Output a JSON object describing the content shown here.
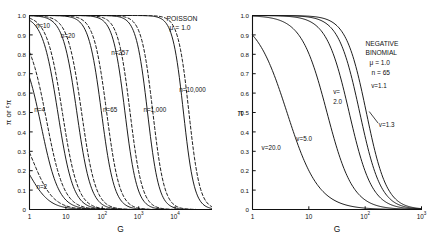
{
  "figure": {
    "background": "#ffffff",
    "ink": "#111111",
    "panel_count": 2
  },
  "chart_data": [
    {
      "type": "line",
      "panel": "left",
      "title": "POISSON",
      "annotations": [
        "POISSON",
        "μ = 1.0"
      ],
      "mu": "1.0",
      "xlabel": "G",
      "ylabel": "π or ᶜπ",
      "xscale": "log",
      "xlim": [
        1,
        100000
      ],
      "ylim": [
        0,
        1
      ],
      "xticks": [
        "1",
        "10",
        "10²",
        "10³",
        "10⁴"
      ],
      "xtick_values": [
        1,
        10,
        100,
        1000,
        10000
      ],
      "yticks": [
        "0",
        "0.1",
        "0.2",
        "0.3",
        "0.4",
        "0.5",
        "0.6",
        "0.7",
        "0.8",
        "0.9",
        "1.0"
      ],
      "ytick_values": [
        0,
        0.1,
        0.2,
        0.3,
        0.4,
        0.5,
        0.6,
        0.7,
        0.8,
        0.9,
        1.0
      ],
      "grid": false,
      "legend": "inline-curve-labels",
      "linestyles": [
        "solid",
        "dashed"
      ],
      "series": [
        {
          "name": "n=2",
          "label": "n=2",
          "style": "solid",
          "y0": 0.36,
          "x50": 1.0,
          "slope": 1.55
        },
        {
          "name": "n=2d",
          "label": "",
          "style": "dashed",
          "y0": 0.5,
          "x50": 1.25,
          "slope": 1.55
        },
        {
          "name": "n=4",
          "label": "n=4",
          "style": "solid",
          "y0": 0.86,
          "x50": 2.1,
          "slope": 1.8
        },
        {
          "name": "n=4d",
          "label": "",
          "style": "dashed",
          "y0": 0.93,
          "x50": 2.9,
          "slope": 1.8
        },
        {
          "name": "n=10",
          "label": "n=10",
          "style": "solid",
          "y0": 1.0,
          "x50": 6.0,
          "slope": 2.05
        },
        {
          "name": "n=10d",
          "label": "",
          "style": "dashed",
          "y0": 1.0,
          "x50": 8.0,
          "slope": 2.05
        },
        {
          "name": "n=20",
          "label": "n=20",
          "style": "solid",
          "y0": 1.0,
          "x50": 20.0,
          "slope": 2.25
        },
        {
          "name": "n=20d",
          "label": "",
          "style": "dashed",
          "y0": 1.0,
          "x50": 27.0,
          "slope": 2.25
        },
        {
          "name": "n=65",
          "label": "n=65",
          "style": "solid",
          "y0": 1.0,
          "x50": 95.0,
          "slope": 2.45
        },
        {
          "name": "n=65d",
          "label": "",
          "style": "dashed",
          "y0": 1.0,
          "x50": 132.0,
          "slope": 2.45
        },
        {
          "name": "n=257",
          "label": "n=257",
          "style": "solid",
          "y0": 1.0,
          "x50": 420.0,
          "slope": 2.6
        },
        {
          "name": "n=257d",
          "label": "",
          "style": "dashed",
          "y0": 1.0,
          "x50": 580.0,
          "slope": 2.6
        },
        {
          "name": "n=1,000",
          "label": "n=1,000",
          "style": "solid",
          "y0": 1.0,
          "x50": 1750.0,
          "slope": 2.75
        },
        {
          "name": "n=1,000d",
          "label": "",
          "style": "dashed",
          "y0": 1.0,
          "x50": 2450.0,
          "slope": 2.75
        },
        {
          "name": "n=10,000",
          "label": "n=10,000",
          "style": "solid",
          "y0": 1.0,
          "x50": 17000.0,
          "slope": 2.9
        },
        {
          "name": "n=10,000d",
          "label": "",
          "style": "dashed",
          "y0": 1.0,
          "x50": 24000.0,
          "slope": 2.9
        }
      ],
      "curve_labels": [
        {
          "text": "n=2",
          "x": 1.55,
          "y": 0.105
        },
        {
          "text": "n=4",
          "x": 1.35,
          "y": 0.505
        },
        {
          "text": "n=10",
          "x": 1.5,
          "y": 0.935
        },
        {
          "text": "n=20",
          "x": 7.2,
          "y": 0.885
        },
        {
          "text": "n=65",
          "x": 105.0,
          "y": 0.505
        },
        {
          "text": "n=257",
          "x": 175.0,
          "y": 0.795
        },
        {
          "text": "n=1,000",
          "x": 1350.0,
          "y": 0.505
        },
        {
          "text": "n=10,000",
          "x": 13000.0,
          "y": 0.605
        }
      ]
    },
    {
      "type": "line",
      "panel": "right",
      "title": "NEGATIVE BINOMIAL",
      "annotations": [
        "NEGATIVE",
        "BINOMIAL",
        "μ = 1.0",
        "n = 65"
      ],
      "mu": "1.0",
      "n": "65",
      "xlabel": "G",
      "ylabel": "π",
      "xscale": "log",
      "xlim": [
        1,
        1000
      ],
      "ylim": [
        0,
        1
      ],
      "xticks": [
        "1",
        "10",
        "10²",
        "10³"
      ],
      "xtick_values": [
        1,
        10,
        100,
        1000
      ],
      "yticks": [
        "0",
        "0.1",
        "0.2",
        "0.3",
        "0.4",
        "0.5",
        "0.6",
        "0.7",
        "0.8",
        "0.9",
        "1.0"
      ],
      "ytick_values": [
        0,
        0.1,
        0.2,
        0.3,
        0.4,
        0.5,
        0.6,
        0.7,
        0.8,
        0.9,
        1.0
      ],
      "grid": false,
      "legend": "inline-curve-labels",
      "linestyles": [
        "solid"
      ],
      "series": [
        {
          "name": "v=20.0",
          "label": "v=20.0",
          "style": "solid",
          "y0": 1.0,
          "x50": 4.1,
          "slope": 1.55
        },
        {
          "name": "v=5.0",
          "label": "v=5.0",
          "style": "solid",
          "y0": 1.0,
          "x50": 21.0,
          "slope": 1.9
        },
        {
          "name": "v=2.0",
          "label": "v=2.0",
          "style": "solid",
          "y0": 1.0,
          "x50": 52.0,
          "slope": 2.15
        },
        {
          "name": "v=1.3",
          "label": "v=1.3",
          "style": "solid",
          "y0": 1.0,
          "x50": 80.0,
          "slope": 2.3
        },
        {
          "name": "v=1.1",
          "label": "v=1.1",
          "style": "solid",
          "y0": 1.0,
          "x50": 105.0,
          "slope": 2.4
        }
      ],
      "curve_labels": [
        {
          "text": "v=20.0",
          "x": 1.45,
          "y": 0.305
        },
        {
          "text": "v=5.0",
          "x": 6.0,
          "y": 0.355
        },
        {
          "text": "v=",
          "x": 27.0,
          "y": 0.595
        },
        {
          "text": "2.0",
          "x": 27.0,
          "y": 0.545
        },
        {
          "text": "v=1.1",
          "x": 128.0,
          "y": 0.625
        },
        {
          "text": "v=1.3",
          "x": 175.0,
          "y": 0.425
        }
      ],
      "leader_line": {
        "from_x": 118.0,
        "from_y": 0.505,
        "to_x": 170.0,
        "to_y": 0.445
      }
    }
  ]
}
